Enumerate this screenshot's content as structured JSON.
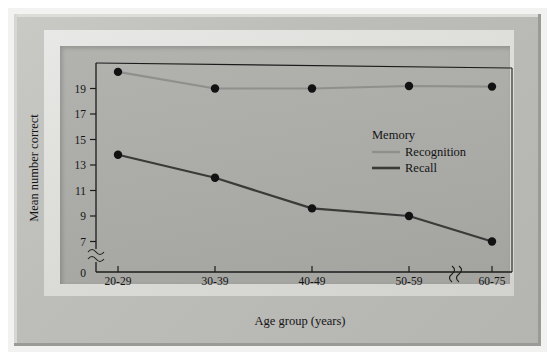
{
  "figure": {
    "y_axis_title": "Mean number correct",
    "x_axis_title": "Age group (years)"
  },
  "legend": {
    "title": "Memory",
    "entries": [
      {
        "label": "Recognition",
        "color": "#8f8f8c"
      },
      {
        "label": "Recall",
        "color": "#3a3a38"
      }
    ]
  },
  "axes": {
    "y_ticks": [
      "0",
      "7",
      "9",
      "11",
      "13",
      "15",
      "17",
      "19"
    ],
    "x_ticks": [
      "20-29",
      "30-39",
      "40-49",
      "50-59",
      "60-75"
    ],
    "y_zero_label": "0",
    "axis_break_symbol": "≈"
  },
  "colors": {
    "recognition": "#8f8f8c",
    "recall": "#3a3a38",
    "marker": "#121212",
    "axis": "#1b1b1b",
    "plot_background": "#aaaaa7",
    "frame_outer": "#b7b7b4",
    "page_background": "#ffffff"
  },
  "chart_data": {
    "type": "line",
    "title": "",
    "xlabel": "Age group (years)",
    "ylabel": "Mean number correct",
    "categories": [
      "20-29",
      "30-39",
      "40-49",
      "50-59",
      "60-75"
    ],
    "series": [
      {
        "name": "Recognition",
        "values": [
          20.3,
          19.0,
          19.0,
          19.2,
          19.15
        ]
      },
      {
        "name": "Recall",
        "values": [
          13.8,
          12.0,
          9.6,
          9.0,
          7.0
        ]
      }
    ],
    "ylim": [
      6,
      21
    ],
    "y_tick_values": [
      7,
      9,
      11,
      13,
      15,
      17,
      19
    ],
    "y_axis_break": true,
    "x_axis_break_between": [
      "50-59",
      "60-75"
    ],
    "grid": false,
    "legend_position": "inside-right",
    "markers": "filled-circle"
  }
}
